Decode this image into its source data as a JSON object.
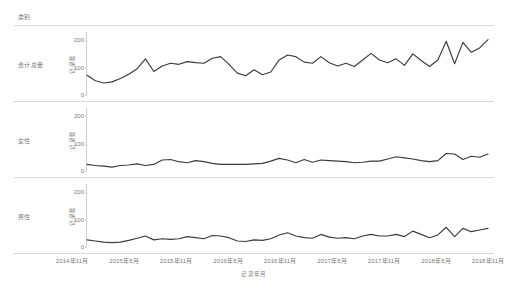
{
  "header": {
    "category_label": "类别"
  },
  "axes": {
    "ylabel": "记录数",
    "xlabel": "记录年月",
    "yticks": [
      "0",
      "100",
      "200"
    ],
    "xticks": [
      "2014年11月",
      "2015年5月",
      "2015年11月",
      "2016年5月",
      "2016年11月",
      "2017年5月",
      "2017年11月",
      "2018年5月",
      "2018年11月"
    ]
  },
  "panels": [
    {
      "label": "合计总量"
    },
    {
      "label": "女性"
    },
    {
      "label": "男性"
    }
  ],
  "chart_data": {
    "type": "line",
    "title": "",
    "subtitle": "",
    "xlabel": "记录年月",
    "ylabel": "记录数",
    "ylim": [
      0,
      230
    ],
    "grid": false,
    "legend": "none",
    "layout": "small-multiples-vertical",
    "facet_variable": "类别",
    "x_tick_labels": [
      "2014年11月",
      "2015年5月",
      "2015年11月",
      "2016年5月",
      "2016年11月",
      "2017年5月",
      "2017年11月",
      "2018年5月",
      "2018年11月"
    ],
    "x": [
      "2014-11",
      "2014-12",
      "2015-01",
      "2015-02",
      "2015-03",
      "2015-04",
      "2015-05",
      "2015-06",
      "2015-07",
      "2015-08",
      "2015-09",
      "2015-10",
      "2015-11",
      "2015-12",
      "2016-01",
      "2016-02",
      "2016-03",
      "2016-04",
      "2016-05",
      "2016-06",
      "2016-07",
      "2016-08",
      "2016-09",
      "2016-10",
      "2016-11",
      "2016-12",
      "2017-01",
      "2017-02",
      "2017-03",
      "2017-04",
      "2017-05",
      "2017-06",
      "2017-07",
      "2017-08",
      "2017-09",
      "2017-10",
      "2017-11",
      "2017-12",
      "2018-01",
      "2018-02",
      "2018-03",
      "2018-04",
      "2018-05",
      "2018-06",
      "2018-07",
      "2018-08",
      "2018-09",
      "2018-10",
      "2018-11"
    ],
    "series": [
      {
        "name": "合计总量",
        "panel": 0,
        "values": [
          72,
          52,
          44,
          48,
          60,
          76,
          96,
          132,
          86,
          106,
          116,
          112,
          122,
          118,
          116,
          134,
          140,
          112,
          80,
          70,
          92,
          74,
          84,
          128,
          146,
          140,
          120,
          116,
          140,
          118,
          106,
          116,
          104,
          128,
          152,
          128,
          118,
          132,
          108,
          150,
          126,
          104,
          128,
          196,
          114,
          192,
          156,
          172,
          202
        ]
      },
      {
        "name": "女性",
        "panel": 1,
        "values": [
          24,
          20,
          18,
          14,
          20,
          22,
          26,
          20,
          24,
          40,
          42,
          34,
          30,
          38,
          34,
          28,
          24,
          24,
          24,
          24,
          26,
          28,
          36,
          46,
          40,
          30,
          42,
          32,
          40,
          38,
          36,
          34,
          30,
          32,
          36,
          36,
          44,
          52,
          48,
          44,
          38,
          34,
          38,
          64,
          62,
          42,
          54,
          50,
          62
        ]
      },
      {
        "name": "男性",
        "panel": 2,
        "values": [
          26,
          22,
          18,
          16,
          18,
          24,
          32,
          40,
          26,
          30,
          28,
          30,
          38,
          34,
          30,
          42,
          40,
          34,
          22,
          20,
          26,
          24,
          30,
          44,
          52,
          40,
          34,
          32,
          46,
          36,
          32,
          34,
          30,
          40,
          46,
          40,
          40,
          46,
          38,
          58,
          46,
          34,
          44,
          72,
          38,
          68,
          56,
          62,
          68
        ]
      }
    ]
  }
}
